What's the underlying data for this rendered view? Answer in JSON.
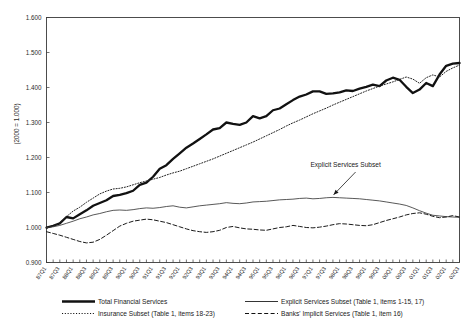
{
  "chart_data": {
    "type": "line",
    "title": "",
    "xlabel": "",
    "ylabel": "(2000 = 1.000)",
    "ylim": [
      0.9,
      1.6
    ],
    "ytick_labels": [
      "0.900",
      "1.000",
      "1.100",
      "1.200",
      "1.300",
      "1.400",
      "1.500",
      "1.600"
    ],
    "ytick_values": [
      0.9,
      1.0,
      1.1,
      1.2,
      1.3,
      1.4,
      1.5,
      1.6
    ],
    "grid": false,
    "legend_position": "below",
    "x": [
      "87Q1",
      "87Q2",
      "87Q3",
      "87Q4",
      "88Q1",
      "88Q2",
      "88Q3",
      "88Q4",
      "89Q1",
      "89Q2",
      "89Q3",
      "89Q4",
      "90Q1",
      "90Q2",
      "90Q3",
      "90Q4",
      "91Q1",
      "91Q2",
      "91Q3",
      "91Q4",
      "92Q1",
      "92Q2",
      "92Q3",
      "92Q4",
      "93Q1",
      "93Q2",
      "93Q3",
      "93Q4",
      "94Q1",
      "94Q2",
      "94Q3",
      "94Q4",
      "95Q1",
      "95Q2",
      "95Q3",
      "95Q4",
      "96Q1",
      "96Q2",
      "96Q3",
      "96Q4",
      "97Q1",
      "97Q2",
      "97Q3",
      "97Q4",
      "98Q1",
      "98Q2",
      "98Q3",
      "98Q4",
      "99Q1",
      "99Q2",
      "99Q3",
      "99Q4",
      "00Q1",
      "00Q2",
      "00Q3",
      "00Q4",
      "01Q1",
      "01Q2",
      "01Q3",
      "01Q4",
      "02Q1",
      "02Q2",
      "02Q3"
    ],
    "xtick_labels": [
      "87Q1",
      "87Q3",
      "88Q1",
      "88Q3",
      "89Q1",
      "89Q3",
      "90Q1",
      "90Q3",
      "91Q1",
      "91Q3",
      "92Q1",
      "92Q3",
      "93Q1",
      "93Q3",
      "94Q1",
      "94Q3",
      "95Q1",
      "95Q3",
      "96Q1",
      "96Q3",
      "97Q1",
      "97Q3",
      "98Q1",
      "98Q3",
      "99Q1",
      "99Q3",
      "00Q1",
      "00Q3",
      "01Q1",
      "01Q3",
      "02Q1",
      "02Q3"
    ],
    "series": [
      {
        "name": "Total Financial Services",
        "style": "solid-thick",
        "color": "#111111",
        "values": [
          1.0,
          1.005,
          1.012,
          1.03,
          1.026,
          1.038,
          1.049,
          1.062,
          1.07,
          1.078,
          1.09,
          1.093,
          1.098,
          1.105,
          1.122,
          1.128,
          1.145,
          1.168,
          1.178,
          1.196,
          1.212,
          1.228,
          1.24,
          1.253,
          1.266,
          1.28,
          1.284,
          1.3,
          1.296,
          1.293,
          1.3,
          1.318,
          1.312,
          1.318,
          1.335,
          1.34,
          1.352,
          1.364,
          1.374,
          1.38,
          1.389,
          1.389,
          1.382,
          1.383,
          1.386,
          1.392,
          1.39,
          1.397,
          1.402,
          1.408,
          1.404,
          1.42,
          1.428,
          1.422,
          1.402,
          1.384,
          1.394,
          1.413,
          1.404,
          1.437,
          1.462,
          1.468,
          1.47
        ]
      },
      {
        "name": "Insurance Subset (Table 1, items 18-23)",
        "style": "dotted",
        "color": "#222222",
        "values": [
          0.997,
          1.004,
          1.013,
          1.031,
          1.047,
          1.058,
          1.072,
          1.084,
          1.096,
          1.104,
          1.11,
          1.112,
          1.116,
          1.122,
          1.128,
          1.133,
          1.138,
          1.143,
          1.15,
          1.156,
          1.161,
          1.168,
          1.175,
          1.182,
          1.189,
          1.196,
          1.204,
          1.212,
          1.22,
          1.228,
          1.236,
          1.244,
          1.253,
          1.262,
          1.271,
          1.28,
          1.29,
          1.299,
          1.307,
          1.316,
          1.325,
          1.333,
          1.341,
          1.35,
          1.358,
          1.366,
          1.374,
          1.382,
          1.39,
          1.397,
          1.404,
          1.41,
          1.416,
          1.423,
          1.43,
          1.424,
          1.412,
          1.428,
          1.436,
          1.43,
          1.446,
          1.456,
          1.464
        ]
      },
      {
        "name": "Explicit Services Subset (Table 1, items 1-15, 17)",
        "style": "solid-thin",
        "color": "#3a3a3a",
        "values": [
          1.0,
          1.002,
          1.006,
          1.012,
          1.018,
          1.025,
          1.03,
          1.036,
          1.04,
          1.045,
          1.049,
          1.05,
          1.049,
          1.051,
          1.054,
          1.056,
          1.055,
          1.057,
          1.06,
          1.062,
          1.058,
          1.056,
          1.059,
          1.062,
          1.064,
          1.066,
          1.068,
          1.071,
          1.069,
          1.068,
          1.07,
          1.073,
          1.074,
          1.075,
          1.077,
          1.079,
          1.08,
          1.081,
          1.083,
          1.084,
          1.082,
          1.083,
          1.085,
          1.086,
          1.085,
          1.084,
          1.083,
          1.082,
          1.08,
          1.078,
          1.076,
          1.073,
          1.07,
          1.067,
          1.063,
          1.056,
          1.048,
          1.041,
          1.035,
          1.033,
          1.031,
          1.03,
          1.029
        ]
      },
      {
        "name": "Banks' Implicit Services (Table 1, item 16)",
        "style": "dashed",
        "color": "#1a1a1a",
        "values": [
          0.988,
          0.983,
          0.978,
          0.972,
          0.966,
          0.96,
          0.956,
          0.958,
          0.966,
          0.978,
          0.991,
          1.004,
          1.012,
          1.018,
          1.021,
          1.024,
          1.022,
          1.018,
          1.014,
          1.008,
          1.002,
          0.996,
          0.991,
          0.988,
          0.986,
          0.988,
          0.992,
          1.0,
          1.003,
          0.999,
          0.996,
          0.995,
          0.993,
          0.992,
          0.996,
          1.0,
          1.002,
          1.006,
          1.003,
          1.0,
          0.999,
          1.001,
          1.004,
          1.008,
          1.011,
          1.01,
          1.008,
          1.006,
          1.005,
          1.008,
          1.014,
          1.02,
          1.025,
          1.03,
          1.036,
          1.04,
          1.042,
          1.038,
          1.032,
          1.028,
          1.03,
          1.034,
          1.03
        ]
      }
    ],
    "annotations": [
      {
        "text": "Explicit Services Subset",
        "x_label": "98Q1",
        "y_value": 1.112,
        "arrow_to_x_label": "98Q1",
        "arrow_to_y_value": 1.082
      }
    ]
  },
  "legend": {
    "entries": [
      {
        "label": "Total Financial Services",
        "style": "solid-thick"
      },
      {
        "label": "Explicit Services Subset (Table 1, items  1-15, 17)",
        "style": "solid-thin"
      },
      {
        "label": "Insurance Subset (Table 1, items 18-23)",
        "style": "dotted"
      },
      {
        "label": "Banks' Implicit Services (Table 1, item 16)",
        "style": "dashed"
      }
    ]
  }
}
